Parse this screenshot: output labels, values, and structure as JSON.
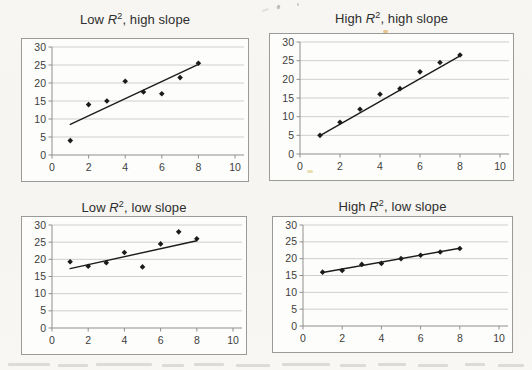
{
  "styles": {
    "paper_bg": "#f7f6f2",
    "chart_bg": "#fdfdfb",
    "border_color": "#9a9a98",
    "grid_color": "#c9c9c7",
    "axis_color": "#8f8f8d",
    "point_color": "#1b1b1b",
    "line_color": "#1c1c1c",
    "title_color": "#2e2e2e",
    "tick_color": "#3d3d3d"
  },
  "chart_data": [
    {
      "type": "scatter",
      "title": "Low R², high slope",
      "title_prefix": "Low ",
      "title_var": "R",
      "title_sup": "2",
      "title_suffix": ", high slope",
      "x": [
        1,
        2,
        3,
        4,
        5,
        6,
        7,
        8
      ],
      "y": [
        4,
        14,
        15,
        20.5,
        17.5,
        17,
        21.5,
        25.5
      ],
      "trendline": {
        "x1": 1,
        "y1": 8.5,
        "x2": 8,
        "y2": 25.2
      },
      "xlim": [
        0,
        10
      ],
      "ylim": [
        0,
        30
      ],
      "xticks": [
        0,
        2,
        4,
        6,
        8,
        10
      ],
      "yticks": [
        0,
        5,
        10,
        15,
        20,
        25,
        30
      ],
      "xlabel": "",
      "ylabel": "",
      "grid": "horizontal",
      "legend": "none",
      "marker": "diamond"
    },
    {
      "type": "scatter",
      "title": "High R², high slope",
      "title_prefix": "High ",
      "title_var": "R",
      "title_sup": "2",
      "title_suffix": ", high slope",
      "x": [
        1,
        2,
        3,
        4,
        5,
        6,
        7,
        8
      ],
      "y": [
        5,
        8.5,
        12,
        16,
        17.5,
        22,
        24.5,
        26.5
      ],
      "trendline": {
        "x1": 1,
        "y1": 4.9,
        "x2": 8,
        "y2": 26.3
      },
      "xlim": [
        0,
        10
      ],
      "ylim": [
        0,
        30
      ],
      "xticks": [
        0,
        2,
        4,
        6,
        8,
        10
      ],
      "yticks": [
        0,
        5,
        10,
        15,
        20,
        25,
        30
      ],
      "xlabel": "",
      "ylabel": "",
      "grid": "horizontal",
      "legend": "none",
      "marker": "diamond"
    },
    {
      "type": "scatter",
      "title": "Low R², low slope",
      "title_prefix": "Low ",
      "title_var": "R",
      "title_sup": "2",
      "title_suffix": ", low slope",
      "x": [
        1,
        2,
        3,
        4,
        5,
        6,
        7,
        8
      ],
      "y": [
        19.3,
        18,
        19,
        22,
        17.8,
        24.5,
        28,
        26
      ],
      "trendline": {
        "x1": 1,
        "y1": 17.3,
        "x2": 8,
        "y2": 25.4
      },
      "xlim": [
        0,
        10
      ],
      "ylim": [
        0,
        30
      ],
      "xticks": [
        0,
        2,
        4,
        6,
        8,
        10
      ],
      "yticks": [
        0,
        5,
        10,
        15,
        20,
        25,
        30
      ],
      "xlabel": "",
      "ylabel": "",
      "grid": "horizontal",
      "legend": "none",
      "marker": "diamond"
    },
    {
      "type": "scatter",
      "title": "High R², low slope",
      "title_prefix": "High ",
      "title_var": "R",
      "title_sup": "2",
      "title_suffix": ", low slope",
      "x": [
        1,
        2,
        3,
        4,
        5,
        6,
        7,
        8
      ],
      "y": [
        16,
        16.5,
        18.3,
        18.6,
        20,
        21,
        22,
        23
      ],
      "trendline": {
        "x1": 1,
        "y1": 15.9,
        "x2": 8,
        "y2": 23.1
      },
      "xlim": [
        0,
        10
      ],
      "ylim": [
        0,
        30
      ],
      "xticks": [
        0,
        2,
        4,
        6,
        8,
        10
      ],
      "yticks": [
        0,
        5,
        10,
        15,
        20,
        25,
        30
      ],
      "xlabel": "",
      "ylabel": "",
      "grid": "horizontal",
      "legend": "none",
      "marker": "diamond"
    }
  ]
}
